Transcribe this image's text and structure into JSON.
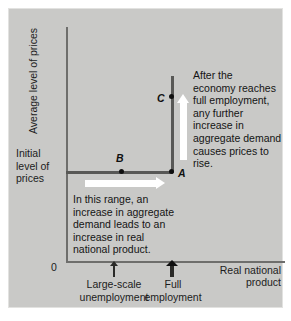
{
  "figure": {
    "background_color": "#c9c9c7",
    "curve_color": "#585856",
    "axis_color": "#6e6e6c",
    "arrow_color": "#ffffff",
    "origin_label": "0"
  },
  "axes": {
    "y_label": "Average level of prices",
    "x_label_line1": "Real national",
    "x_label_line2": "product",
    "y_tick_label_line1": "Initial",
    "y_tick_label_line2": "level of",
    "y_tick_label_line3": "prices",
    "x_tick_unemployment_line1": "Large-scale",
    "x_tick_unemployment_line2": "unemployment",
    "x_tick_fullemployment_line1": "Full",
    "x_tick_fullemployment_line2": "employment"
  },
  "points": {
    "a": "A",
    "b": "B",
    "c": "C"
  },
  "annotations": {
    "upper": {
      "l1": "After the",
      "l2": "economy reaches",
      "l3": "full employment,",
      "l4": "any further",
      "l5": "increase in",
      "l6": "aggregate demand",
      "l7": "causes prices to",
      "l8": "rise."
    },
    "lower": {
      "l1": "In this range, an",
      "l2": "increase in aggregate",
      "l3": "demand leads to an",
      "l4": "increase in real",
      "l5": "national product."
    }
  },
  "chart_data": {
    "type": "line",
    "title": "",
    "xlabel": "Real national product",
    "ylabel": "Average level of prices",
    "xlim": [
      0,
      100
    ],
    "ylim": [
      0,
      100
    ],
    "grid": false,
    "legend": "none",
    "series": [
      {
        "name": "Aggregate supply curve",
        "x": [
          0,
          48,
          48
        ],
        "y": [
          38,
          38,
          84
        ],
        "description": "Horizontal at the initial price level up to full employment, then vertical at full employment output"
      }
    ],
    "annotated_points": [
      {
        "label": "A",
        "x": 48,
        "y": 38,
        "note": "Full employment at initial level of prices"
      },
      {
        "label": "B",
        "x": 24,
        "y": 38,
        "note": "Large-scale unemployment at initial level of prices"
      },
      {
        "label": "C",
        "x": 48,
        "y": 72,
        "note": "Above full employment, higher price level"
      }
    ],
    "x_ticks": [
      {
        "value": 24,
        "label": "Large-scale unemployment"
      },
      {
        "value": 48,
        "label": "Full employment"
      }
    ],
    "y_ticks": [
      {
        "value": 38,
        "label": "Initial level of prices"
      }
    ],
    "arrows": [
      {
        "name": "horizontal-expansion-arrow",
        "direction": "right",
        "color": "#ffffff",
        "note": "In this range, an increase in aggregate demand leads to an increase in real national product."
      },
      {
        "name": "vertical-price-arrow",
        "direction": "up",
        "color": "#ffffff",
        "note": "After the economy reaches full employment, any further increase in aggregate demand causes prices to rise."
      }
    ]
  }
}
